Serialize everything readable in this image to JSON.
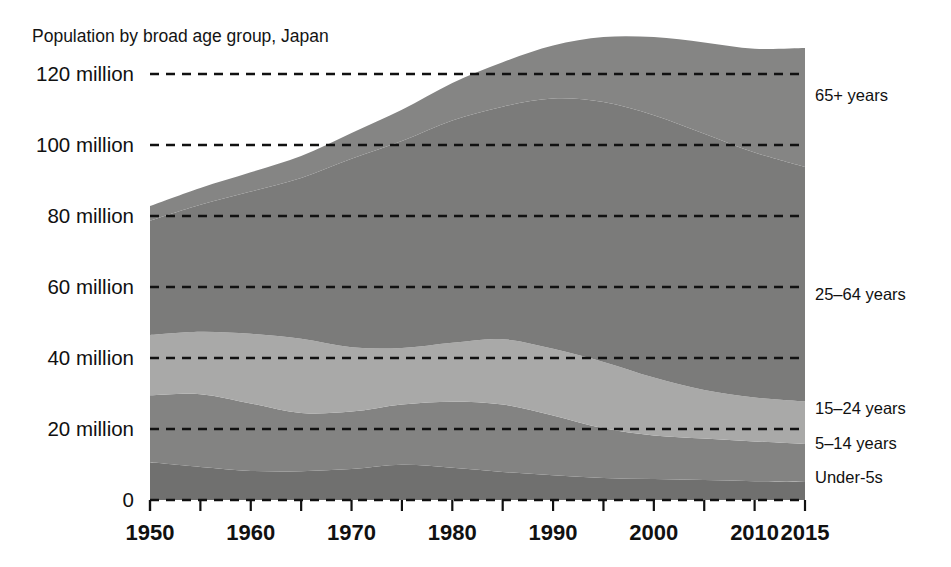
{
  "chart_data": {
    "type": "area",
    "stacked": true,
    "title": "Population by broad age group, Japan",
    "xlabel": "",
    "ylabel": "",
    "xlim": [
      1950,
      2015
    ],
    "ylim": [
      0,
      130
    ],
    "grid": true,
    "legend_position": "right-inline",
    "units": "million people",
    "x": [
      1950,
      1955,
      1960,
      1965,
      1970,
      1975,
      1980,
      1985,
      1990,
      1995,
      2000,
      2005,
      2010,
      2015
    ],
    "y_ticks": [
      0,
      20,
      40,
      60,
      80,
      100,
      120
    ],
    "y_tick_labels": [
      "0",
      "20 million",
      "40 million",
      "60 million",
      "80 million",
      "100 million",
      "120 million"
    ],
    "x_ticks": [
      1950,
      1955,
      1960,
      1965,
      1970,
      1975,
      1980,
      1985,
      1990,
      1995,
      2000,
      2005,
      2010,
      2015
    ],
    "x_tick_labels_shown": [
      "1950",
      "1960",
      "1970",
      "1980",
      "1990",
      "2000",
      "2010",
      "2015"
    ],
    "series": [
      {
        "name": "Under-5s",
        "label": "Under-5s",
        "color": "#70706f",
        "values": [
          10.6,
          9.3,
          8.2,
          8.1,
          8.7,
          9.9,
          9.1,
          7.9,
          7.0,
          6.2,
          5.9,
          5.6,
          5.3,
          5.1
        ]
      },
      {
        "name": "5-14 years",
        "label": "5–14 years",
        "color": "#838382",
        "values": [
          18.9,
          20.5,
          19.0,
          16.4,
          16.2,
          17.0,
          18.6,
          19.0,
          16.8,
          14.0,
          12.3,
          11.7,
          11.2,
          10.7
        ]
      },
      {
        "name": "15-24 years",
        "label": "15–24 years",
        "color": "#a9a9a8",
        "values": [
          17.0,
          17.6,
          19.6,
          20.9,
          18.1,
          15.9,
          16.6,
          18.4,
          18.8,
          18.7,
          16.3,
          13.7,
          12.4,
          12.0
        ]
      },
      {
        "name": "25-64 years",
        "label": "25–64 years",
        "color": "#7b7b7a",
        "values": [
          32.2,
          35.8,
          40.1,
          45.3,
          53.1,
          58.3,
          62.6,
          65.5,
          70.5,
          73.2,
          73.9,
          72.2,
          69.0,
          66.0
        ]
      },
      {
        "name": "65+ years",
        "label": "65+ years",
        "color": "#858584",
        "values": [
          4.1,
          4.7,
          5.4,
          6.2,
          7.3,
          8.8,
          10.6,
          12.5,
          14.9,
          18.3,
          22.0,
          25.7,
          29.2,
          33.5
        ]
      }
    ],
    "series_label_positions": [
      {
        "name": "65+ years",
        "y_value": 114
      },
      {
        "name": "25-64 years",
        "y_value": 58
      },
      {
        "name": "15-24 years",
        "y_value": 26
      },
      {
        "name": "5-14 years",
        "y_value": 16
      },
      {
        "name": "Under-5s",
        "y_value": 6.5
      }
    ]
  }
}
